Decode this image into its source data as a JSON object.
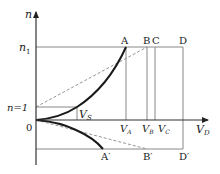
{
  "diagram": {
    "axes": {
      "y_label": "n",
      "x_label": "V_D",
      "origin_label": "0"
    },
    "y_ticks": {
      "n1": {
        "main": "n",
        "sub": "1"
      },
      "n_equals_1": "n=1"
    },
    "top_points": [
      "A",
      "B",
      "C",
      "D"
    ],
    "bottom_points": [
      "A′",
      "B′",
      "D′"
    ],
    "x_ticks": [
      {
        "main": "V",
        "sub": "A"
      },
      {
        "main": "V",
        "sub": "B"
      },
      {
        "main": "V",
        "sub": "C"
      },
      {
        "main": "V",
        "sub": "D"
      }
    ],
    "vs_label": {
      "main": "V",
      "sub": "S"
    },
    "colors": {
      "axis": "#333333",
      "curve": "#1a1a1a",
      "guide": "#888888",
      "dashed": "#888888"
    }
  }
}
